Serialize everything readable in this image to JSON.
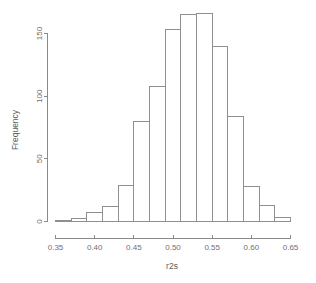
{
  "chart_data": {
    "type": "bar",
    "subtype": "histogram",
    "title": "",
    "xlabel": "r2s",
    "ylabel": "Frequency",
    "xlim": [
      0.35,
      0.65
    ],
    "ylim": [
      0,
      170
    ],
    "grid": false,
    "legend": null,
    "bin_width": 0.02,
    "bin_edges": [
      0.35,
      0.37,
      0.39,
      0.41,
      0.43,
      0.45,
      0.47,
      0.49,
      0.51,
      0.53,
      0.55,
      0.57,
      0.59,
      0.61,
      0.63,
      0.65
    ],
    "categories": [
      "0.35-0.37",
      "0.37-0.39",
      "0.39-0.41",
      "0.41-0.43",
      "0.43-0.45",
      "0.45-0.47",
      "0.47-0.49",
      "0.49-0.51",
      "0.51-0.53",
      "0.53-0.55",
      "0.55-0.57",
      "0.57-0.59",
      "0.59-0.61",
      "0.61-0.63",
      "0.63-0.65"
    ],
    "values": [
      1,
      2,
      7,
      12,
      29,
      80,
      108,
      153,
      165,
      166,
      140,
      84,
      28,
      13,
      3
    ],
    "x_ticks": [
      0.35,
      0.4,
      0.45,
      0.5,
      0.55,
      0.6,
      0.65
    ],
    "x_tick_labels": [
      "0.35",
      "0.40",
      "0.45",
      "0.50",
      "0.55",
      "0.60",
      "0.65"
    ],
    "y_ticks": [
      0,
      50,
      100,
      150
    ],
    "y_tick_labels": [
      "0",
      "50",
      "100",
      "150"
    ],
    "colors": {
      "bar_fill": "#ffffff",
      "bar_stroke": "#8f8f8f",
      "axis": "#8a8a8a",
      "text": "#6f6f6f",
      "background": "#ffffff"
    }
  },
  "axes": {
    "x_axis_title": "r2s",
    "y_axis_title": "Frequency"
  }
}
